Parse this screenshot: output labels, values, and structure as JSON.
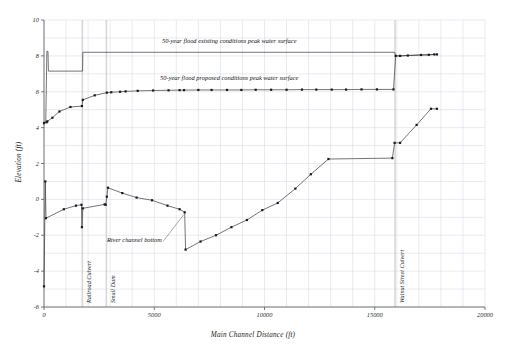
{
  "chart_data": {
    "type": "line",
    "title": "",
    "xlabel": "Main Channel Distance (ft)",
    "ylabel": "Elevation (ft)",
    "xlim": [
      0,
      20000
    ],
    "ylim": [
      -6,
      10
    ],
    "xticks": [
      0,
      5000,
      10000,
      15000,
      20000
    ],
    "yticks": [
      -6,
      -4,
      -2,
      0,
      2,
      4,
      6,
      8,
      10
    ],
    "grid": true,
    "gridline_step_x": 1000,
    "gridline_step_y": 1,
    "legend": "inline-annotations",
    "series": [
      {
        "name": "50-year flood existing conditions peak water surface",
        "marker": "none",
        "points": [
          [
            0,
            4.3
          ],
          [
            80,
            4.3
          ],
          [
            130,
            8.25
          ],
          [
            180,
            8.25
          ],
          [
            200,
            7.15
          ],
          [
            1750,
            7.15
          ],
          [
            1760,
            8.2
          ],
          [
            15900,
            8.2
          ],
          [
            15950,
            8.0
          ],
          [
            16150,
            8.0
          ],
          [
            16500,
            8.02
          ],
          [
            17100,
            8.05
          ],
          [
            17450,
            8.06
          ],
          [
            17700,
            8.08
          ],
          [
            17820,
            8.08
          ]
        ]
      },
      {
        "name": "50-year flood proposed conditions peak water surface",
        "marker": "square",
        "points": [
          [
            0,
            4.25
          ],
          [
            120,
            4.3
          ],
          [
            150,
            4.35
          ],
          [
            380,
            4.55
          ],
          [
            700,
            4.9
          ],
          [
            1200,
            5.15
          ],
          [
            1720,
            5.2
          ],
          [
            1760,
            5.55
          ],
          [
            2300,
            5.8
          ],
          [
            2850,
            5.95
          ],
          [
            3050,
            5.97
          ],
          [
            3450,
            6.0
          ],
          [
            3700,
            6.02
          ],
          [
            4250,
            6.05
          ],
          [
            4950,
            6.07
          ],
          [
            5650,
            6.08
          ],
          [
            6150,
            6.09
          ],
          [
            6350,
            6.09
          ],
          [
            7000,
            6.1
          ],
          [
            7600,
            6.1
          ],
          [
            8300,
            6.1
          ],
          [
            8950,
            6.1
          ],
          [
            9600,
            6.11
          ],
          [
            10300,
            6.11
          ],
          [
            11000,
            6.11
          ],
          [
            11700,
            6.12
          ],
          [
            12350,
            6.12
          ],
          [
            13050,
            6.12
          ],
          [
            13700,
            6.12
          ],
          [
            14400,
            6.13
          ],
          [
            15100,
            6.13
          ],
          [
            15850,
            6.13
          ],
          [
            15950,
            8.0
          ],
          [
            16150,
            8.0
          ],
          [
            16500,
            8.02
          ],
          [
            17100,
            8.05
          ],
          [
            17450,
            8.06
          ],
          [
            17700,
            8.08
          ],
          [
            17820,
            8.08
          ]
        ]
      },
      {
        "name": "River channel bottom",
        "marker": "square",
        "points": [
          [
            0,
            -4.85
          ],
          [
            60,
            1.0
          ],
          [
            90,
            -1.05
          ],
          [
            900,
            -0.55
          ],
          [
            1450,
            -0.35
          ],
          [
            1700,
            -0.3
          ],
          [
            1720,
            -1.55
          ],
          [
            1760,
            -0.5
          ],
          [
            2750,
            -0.28
          ],
          [
            2800,
            -0.3
          ],
          [
            2850,
            0.15
          ],
          [
            2900,
            0.65
          ],
          [
            3550,
            0.35
          ],
          [
            4200,
            0.1
          ],
          [
            4900,
            -0.05
          ],
          [
            5600,
            -0.35
          ],
          [
            6150,
            -0.55
          ],
          [
            6380,
            -0.72
          ],
          [
            6420,
            -2.8
          ],
          [
            7100,
            -2.35
          ],
          [
            7800,
            -2.0
          ],
          [
            8500,
            -1.55
          ],
          [
            9200,
            -1.15
          ],
          [
            9900,
            -0.6
          ],
          [
            10600,
            -0.2
          ],
          [
            11400,
            0.6
          ],
          [
            12100,
            1.4
          ],
          [
            12900,
            2.25
          ],
          [
            15800,
            2.3
          ],
          [
            15900,
            3.15
          ],
          [
            16150,
            3.15
          ],
          [
            16900,
            4.15
          ],
          [
            17550,
            5.05
          ],
          [
            17820,
            5.05
          ]
        ]
      }
    ],
    "annotations": [
      {
        "name": "existing-conditions-label",
        "text": "50-year flood existing conditions peak water surface",
        "x": 8400,
        "y": 8.85
      },
      {
        "name": "proposed-conditions-label",
        "text": "50-year flood proposed conditions peak water surface",
        "x": 8400,
        "y": 6.75
      },
      {
        "name": "river-channel-bottom-label",
        "text": "River channel bottom",
        "x": 4100,
        "y": -2.25
      }
    ],
    "structures": [
      {
        "name": "railroad-culvert",
        "label": "Railroad Culvert",
        "x": 1740
      },
      {
        "name": "small-dam",
        "label": "Small Dam",
        "x": 2830
      },
      {
        "name": "walnut-street-culvert",
        "label": "Walnut Street Culvert",
        "x": 15920
      }
    ]
  }
}
